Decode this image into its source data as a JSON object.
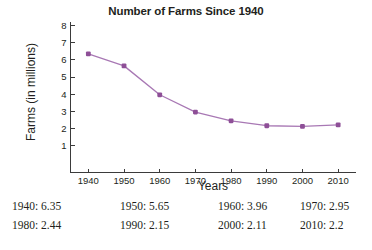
{
  "chart_data": {
    "type": "line",
    "title": "Number of Farms Since 1940",
    "xlabel": "Years",
    "ylabel": "Farms (in millions)",
    "x": [
      1940,
      1950,
      1960,
      1970,
      1980,
      1990,
      2000,
      2010
    ],
    "values": [
      6.35,
      5.65,
      3.96,
      2.95,
      2.44,
      2.15,
      2.11,
      2.2
    ],
    "xtick_labels": [
      "1940",
      "1950",
      "1960",
      "1970",
      "1980",
      "1990",
      "2000",
      "2010"
    ],
    "ytick_labels": [
      "1",
      "2",
      "3",
      "4",
      "5",
      "6",
      "7",
      "8"
    ],
    "yticks": [
      1,
      2,
      3,
      4,
      5,
      6,
      7,
      8
    ],
    "xlim": [
      1935,
      2015
    ],
    "ylim": [
      0,
      8.6
    ],
    "grid": false,
    "legend": false,
    "line_color": "#a878b4",
    "marker_color": "#8e4f97",
    "axis_color": "#3b3b3b"
  },
  "data_table": {
    "rows": [
      [
        {
          "label": "1940:",
          "value": "6.35",
          "text": "1940: 6.35"
        },
        {
          "label": "1950:",
          "value": "5.65",
          "text": "1950: 5.65"
        },
        {
          "label": "1960:",
          "value": "3.96",
          "text": "1960: 3.96"
        },
        {
          "label": "1970:",
          "value": "2.95",
          "text": "1970: 2.95"
        }
      ],
      [
        {
          "label": "1980:",
          "value": "2.44",
          "text": "1980: 2.44"
        },
        {
          "label": "1990:",
          "value": "2.15",
          "text": "1990: 2.15"
        },
        {
          "label": "2000:",
          "value": "2.11",
          "text": "2000: 2.11"
        },
        {
          "label": "2010:",
          "value": "2.2",
          "text": "2010: 2.2"
        }
      ]
    ]
  }
}
